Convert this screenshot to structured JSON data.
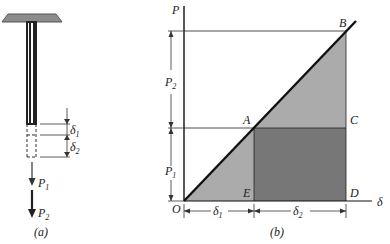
{
  "figure_a": {
    "caption": "(a)",
    "labels": {
      "delta1": "δ",
      "delta1_sub": "1",
      "delta2": "δ",
      "delta2_sub": "2",
      "load1": "P",
      "load1_sub": "1",
      "load2": "P",
      "load2_sub": "2"
    },
    "colors": {
      "support": "#8c8c8c",
      "bar": "#2a2a2a"
    }
  },
  "figure_b": {
    "caption": "(b)",
    "axis": {
      "y_label": "P",
      "x_label": "δ",
      "origin_label": "O"
    },
    "points": {
      "A": "A",
      "B": "B",
      "C": "C",
      "D": "D",
      "E": "E"
    },
    "dims": {
      "p1": "P",
      "p1_sub": "1",
      "p2": "P",
      "p2_sub": "2",
      "d1": "δ",
      "d1_sub": "1",
      "d2": "δ",
      "d2_sub": "2"
    },
    "colors": {
      "light_area": "#ababab",
      "dark_area": "#777777",
      "line": "#111111"
    }
  }
}
